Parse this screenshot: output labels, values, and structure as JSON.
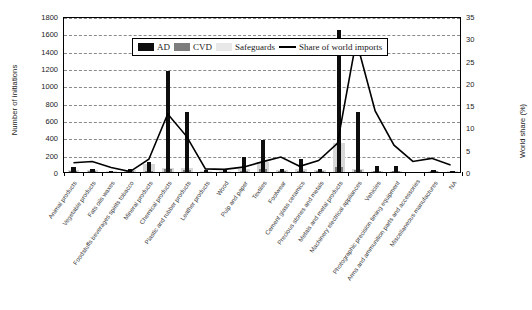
{
  "chart_data": {
    "type": "bar",
    "title": "",
    "xlabel": "",
    "ylabel": "Number of initiations",
    "y2label": "World share (%)",
    "ylim": [
      0,
      1800
    ],
    "y2lim": [
      0,
      35
    ],
    "yticks": [
      0,
      200,
      400,
      600,
      800,
      1000,
      1200,
      1400,
      1600,
      1800
    ],
    "y2ticks": [
      0,
      5,
      10,
      15,
      20,
      25,
      30,
      35
    ],
    "grid": true,
    "legend_position": "top-left-inside",
    "legend": [
      "AD",
      "CVD",
      "Safeguards",
      "Share of world imports"
    ],
    "colors": {
      "AD": "#0d0d0d",
      "CVD": "#7d7d7d",
      "Safeguards": "#e8e8e8",
      "Share of world imports": "#000000"
    },
    "categories": [
      "Animal products",
      "Vegetable products",
      "Fats oils waxes",
      "Foodstuffs beverages spirits tobacco",
      "Mineral products",
      "Chemical products",
      "Plastic and rubber products",
      "Leather products",
      "Wood",
      "Pulp and paper",
      "Textiles",
      "Footwear",
      "Cement glass ceramics",
      "Precious stones and metals",
      "Metals and metal products",
      "Machinery electrical appliances",
      "Vehicles",
      "Photographic precision timing equipment",
      "Arms and ammunition parts and accessories",
      "Miscellaneous manufactures",
      "NA"
    ],
    "series": [
      {
        "name": "AD",
        "axis": "left",
        "values": [
          55,
          30,
          15,
          30,
          115,
          1170,
          690,
          25,
          20,
          175,
          375,
          35,
          155,
          30,
          1640,
          690,
          65,
          75,
          0,
          25,
          10
        ]
      },
      {
        "name": "CVD",
        "axis": "left",
        "values": [
          10,
          5,
          0,
          5,
          10,
          40,
          20,
          0,
          0,
          15,
          30,
          5,
          10,
          5,
          60,
          25,
          5,
          5,
          0,
          5,
          0
        ]
      },
      {
        "name": "Safeguards",
        "axis": "left",
        "values": [
          25,
          20,
          10,
          25,
          95,
          50,
          45,
          10,
          15,
          35,
          110,
          20,
          40,
          20,
          330,
          40,
          15,
          15,
          0,
          15,
          5
        ]
      },
      {
        "name": "Share of world imports",
        "axis": "right",
        "type": "line",
        "values": [
          2.1,
          2.4,
          1.0,
          0.1,
          2.9,
          13.2,
          8.1,
          0.7,
          0.6,
          1.1,
          2.3,
          3.4,
          1.3,
          2.6,
          6.5,
          29.9,
          13.9,
          6.1,
          2.4,
          3.1,
          1.6
        ]
      }
    ]
  },
  "legend": {
    "items": [
      {
        "label": "AD",
        "swatch": "ad"
      },
      {
        "label": "CVD",
        "swatch": "cvd"
      },
      {
        "label": "Safeguards",
        "swatch": "sg"
      },
      {
        "label": "Share of world imports",
        "swatch": "line"
      }
    ]
  },
  "axes": {
    "left_title": "Number of initiations",
    "right_title": "World share (%)"
  }
}
